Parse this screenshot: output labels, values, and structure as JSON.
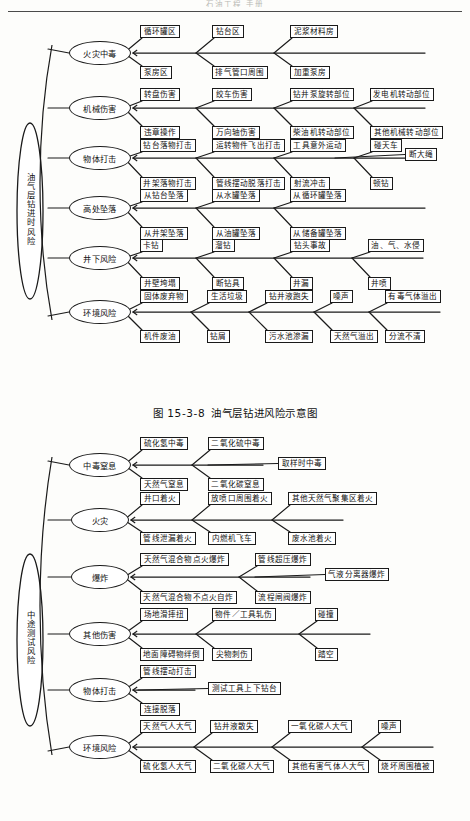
{
  "page": {
    "header_faint": "石油工程 手册",
    "background": "#fdfdfb",
    "ink": "#1a1a1a"
  },
  "caption": {
    "number": "图 15-3-8",
    "text": "油气层钻进风险示意图"
  },
  "diagrams": [
    {
      "id": "drilling-risk",
      "trunk_label": "油气层钻进时风险",
      "branches": [
        {
          "name": "火灾中毒",
          "top": [
            "循环罐区",
            "钻台区",
            "泥浆材料房"
          ],
          "bottom": [
            "泵房区",
            "排气管口周围",
            "加重泵房"
          ],
          "inline": []
        },
        {
          "name": "机械伤害",
          "top": [
            "转盘伤害",
            "绞车伤害",
            "钻井泵旋转部位",
            "发电机转动部位"
          ],
          "bottom": [
            "违章操作",
            "万向轴伤害",
            "柴油机转动部位",
            "其他机械转动部位"
          ],
          "inline": []
        },
        {
          "name": "物体打击",
          "top": [
            "钻台落物打击",
            "运转物件飞出打击",
            "工具意外运动",
            "碰天车"
          ],
          "bottom": [
            "井架落物打击",
            "管线摆动脱落打击",
            "射流冲击",
            "顿钻"
          ],
          "inline": [
            "断大绳"
          ]
        },
        {
          "name": "高处坠落",
          "top": [
            "从钻台坠落",
            "从水罐坠落",
            "从循环罐坠落"
          ],
          "bottom": [
            "从井架坠落",
            "从油罐坠落",
            "从储备罐坠落"
          ],
          "inline": []
        },
        {
          "name": "井下风险",
          "top": [
            "卡钻",
            "溜钻",
            "钻头事故",
            "油、气、水侵"
          ],
          "bottom": [
            "井壁垮塌",
            "断钻具",
            "井漏",
            "井喷"
          ],
          "inline": []
        },
        {
          "name": "环境风险",
          "top": [
            "固体废弃物",
            "生活垃圾",
            "钻井液跑失",
            "噪声",
            "有毒气体溢出"
          ],
          "bottom": [
            "机件废油",
            "钻屑",
            "污水池渗漏",
            "天然气溢出",
            "分流不清"
          ],
          "inline": []
        }
      ]
    },
    {
      "id": "dst-risk",
      "trunk_label": "中途测试风险",
      "branches": [
        {
          "name": "中毒窒息",
          "top": [
            "硫化氢中毒",
            "二氧化硫中毒"
          ],
          "bottom": [
            "天然气窒息",
            "二氧化碳窒息"
          ],
          "inline": [
            "取样时中毒"
          ]
        },
        {
          "name": "火灾",
          "top": [
            "井口着火",
            "放喷口周围着火",
            "其他天然气聚集区着火"
          ],
          "bottom": [
            "管线泄漏着火",
            "内燃机飞车",
            "废水池着火"
          ],
          "inline": []
        },
        {
          "name": "爆炸",
          "top": [
            "天然气混合物点火爆炸",
            "管线超压爆炸"
          ],
          "bottom": [
            "天然气混合物不点火自炸",
            "流程闸阀爆炸"
          ],
          "inline": [
            "气液分离器爆炸"
          ]
        },
        {
          "name": "其他伤害",
          "top": [
            "场地滑摔扭",
            "物件／工具轧伤",
            "碰撞"
          ],
          "bottom": [
            "地面障碍物绊倒",
            "尖物刺伤",
            "踏空"
          ],
          "inline": []
        },
        {
          "name": "物体打击",
          "top": [
            "管线摆动打击"
          ],
          "bottom": [
            "连接脱落"
          ],
          "inline": [
            "测试工具上下钻台"
          ]
        },
        {
          "name": "环境风险",
          "top": [
            "天然气人大气",
            "钻井液散失",
            "一氧化碳人大气",
            "噪声"
          ],
          "bottom": [
            "硫化氢人大气",
            "二氧化碳人大气",
            "其他有害气体人大气",
            "烧坏周围植被"
          ],
          "inline": []
        }
      ]
    }
  ]
}
